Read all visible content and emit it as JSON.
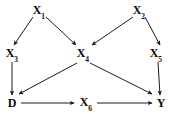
{
  "diagram": {
    "type": "causal-dag",
    "title": "",
    "width": 175,
    "height": 114,
    "background_color": "#ffffff",
    "edge_color": "#1a1a1a",
    "label_color": "#0d0d0d",
    "nodes": [
      {
        "id": "X1",
        "base": "X",
        "sub": "1",
        "x": 39,
        "y": 11,
        "row": "top"
      },
      {
        "id": "X2",
        "base": "X",
        "sub": "2",
        "x": 139,
        "y": 11,
        "row": "top"
      },
      {
        "id": "X3",
        "base": "X",
        "sub": "3",
        "x": 12,
        "y": 54,
        "row": "middle"
      },
      {
        "id": "X4",
        "base": "X",
        "sub": "4",
        "x": 83,
        "y": 54,
        "row": "middle"
      },
      {
        "id": "X5",
        "base": "X",
        "sub": "5",
        "x": 156,
        "y": 54,
        "row": "middle"
      },
      {
        "id": "D",
        "base": "D",
        "sub": "",
        "x": 12,
        "y": 103,
        "row": "bottom"
      },
      {
        "id": "X6",
        "base": "X",
        "sub": "6",
        "x": 86,
        "y": 103,
        "row": "bottom"
      },
      {
        "id": "Y",
        "base": "Y",
        "sub": "",
        "x": 161,
        "y": 103,
        "row": "bottom"
      }
    ],
    "edges": [
      {
        "id": "X1-X3",
        "from": "X1",
        "to": "X3",
        "x1": 33,
        "y1": 17,
        "x2": 14,
        "y2": 45
      },
      {
        "id": "X1-X4",
        "from": "X1",
        "to": "X4",
        "x1": 46,
        "y1": 17,
        "x2": 76,
        "y2": 45
      },
      {
        "id": "X2-X4",
        "from": "X2",
        "to": "X4",
        "x1": 133,
        "y1": 17,
        "x2": 92,
        "y2": 45
      },
      {
        "id": "X2-X5",
        "from": "X2",
        "to": "X5",
        "x1": 145,
        "y1": 17,
        "x2": 160,
        "y2": 45
      },
      {
        "id": "X3-D",
        "from": "X3",
        "to": "D",
        "x1": 12,
        "y1": 62,
        "x2": 12,
        "y2": 95
      },
      {
        "id": "X4-D",
        "from": "X4",
        "to": "D",
        "x1": 77,
        "y1": 63,
        "x2": 19,
        "y2": 94
      },
      {
        "id": "X4-Y",
        "from": "X4",
        "to": "Y",
        "x1": 90,
        "y1": 63,
        "x2": 152,
        "y2": 94
      },
      {
        "id": "X5-Y",
        "from": "X5",
        "to": "Y",
        "x1": 158,
        "y1": 62,
        "x2": 160,
        "y2": 95
      },
      {
        "id": "D-X6",
        "from": "D",
        "to": "X6",
        "x1": 21,
        "y1": 103,
        "x2": 74,
        "y2": 103
      },
      {
        "id": "X6-Y",
        "from": "X6",
        "to": "Y",
        "x1": 97,
        "y1": 103,
        "x2": 152,
        "y2": 103
      }
    ]
  }
}
